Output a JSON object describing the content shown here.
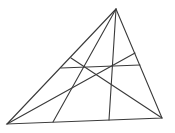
{
  "diagram": {
    "type": "triangle-cevians",
    "stroke_color": "#3a3a3a",
    "background": "#ffffff",
    "vertices": {
      "A": [
        116,
        9
      ],
      "B": [
        7,
        124
      ],
      "C": [
        162,
        118
      ]
    },
    "segments": [
      {
        "name": "side-ab",
        "from": [
          116,
          9
        ],
        "to": [
          7,
          124
        ]
      },
      {
        "name": "side-bc",
        "from": [
          7,
          124
        ],
        "to": [
          162,
          118
        ]
      },
      {
        "name": "side-ca",
        "from": [
          162,
          118
        ],
        "to": [
          116,
          9
        ]
      },
      {
        "name": "cevian-a-left",
        "from": [
          116,
          9
        ],
        "to": [
          53,
          122
        ]
      },
      {
        "name": "cevian-a-right",
        "from": [
          116,
          9
        ],
        "to": [
          109,
          120
        ]
      },
      {
        "name": "cevian-b",
        "from": [
          7,
          124
        ],
        "to": [
          135,
          53
        ]
      },
      {
        "name": "cevian-c",
        "from": [
          162,
          118
        ],
        "to": [
          71,
          58
        ]
      },
      {
        "name": "transversal",
        "from": [
          61,
          68
        ],
        "to": [
          140,
          65
        ]
      }
    ]
  }
}
